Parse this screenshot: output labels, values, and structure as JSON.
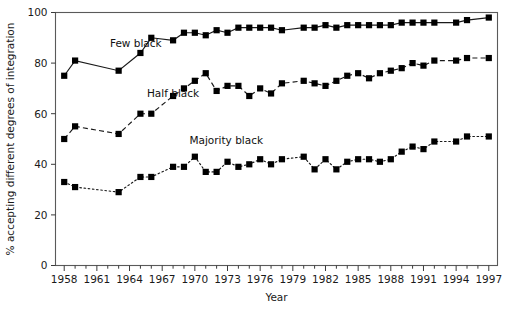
{
  "chart_data": {
    "type": "line",
    "title": "",
    "xlabel": "Year",
    "ylabel": "% accepting different degrees of integration",
    "xlim": [
      1957.2,
      1997.8
    ],
    "ylim": [
      0,
      100
    ],
    "xticks_major": [
      1958,
      1961,
      1964,
      1967,
      1970,
      1973,
      1976,
      1979,
      1982,
      1985,
      1988,
      1991,
      1994,
      1997
    ],
    "xticks_minor_every": 1,
    "yticks": [
      0,
      20,
      40,
      60,
      80,
      100
    ],
    "grid": false,
    "legend_position": "inline-annotations",
    "x": [
      1958,
      1959,
      1963,
      1965,
      1966,
      1968,
      1969,
      1970,
      1971,
      1972,
      1973,
      1974,
      1975,
      1976,
      1977,
      1978,
      1980,
      1981,
      1982,
      1983,
      1984,
      1985,
      1986,
      1987,
      1988,
      1989,
      1990,
      1991,
      1992,
      1994,
      1995,
      1997
    ],
    "series": [
      {
        "name": "Few black",
        "linestyle": "solid",
        "marker": "square",
        "values": [
          75,
          81,
          77,
          84,
          90,
          89,
          92,
          92,
          91,
          93,
          92,
          94,
          94,
          94,
          94,
          93,
          94,
          94,
          95,
          94,
          95,
          95,
          95,
          95,
          95,
          96,
          96,
          96,
          96,
          96,
          97,
          98
        ]
      },
      {
        "name": "Half black",
        "linestyle": "dashed",
        "marker": "square",
        "values": [
          50,
          55,
          52,
          60,
          60,
          67,
          70,
          73,
          76,
          69,
          71,
          71,
          67,
          70,
          68,
          72,
          73,
          72,
          71,
          73,
          75,
          76,
          74,
          76,
          77,
          78,
          80,
          79,
          81,
          81,
          82,
          82
        ]
      },
      {
        "name": "Majority black",
        "linestyle": "dotted",
        "marker": "square",
        "values": [
          33,
          31,
          29,
          35,
          35,
          39,
          39,
          43,
          37,
          37,
          41,
          39,
          40,
          42,
          40,
          42,
          43,
          38,
          42,
          38,
          41,
          42,
          42,
          41,
          42,
          45,
          47,
          46,
          49,
          49,
          51,
          51
        ]
      }
    ],
    "annotations": [
      {
        "text": "Few black",
        "x": 1962.2,
        "y": 86.5
      },
      {
        "text": "Half black",
        "x": 1965.6,
        "y": 66.5
      },
      {
        "text": "Majority black",
        "x": 1969.5,
        "y": 48.0
      }
    ]
  },
  "colors": {
    "marker": "#000000",
    "line": "#1a1a1a",
    "axis": "#5a5a5a",
    "text": "#1a1a1a",
    "background": "#ffffff"
  }
}
